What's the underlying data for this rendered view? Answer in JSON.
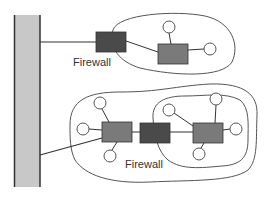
{
  "diagram": {
    "title": "",
    "colors": {
      "backbone_fill": "#c8c8c8",
      "backbone_border": "#333333",
      "firewall_fill": "#4a4a4a",
      "router_fill": "#7a7a7a",
      "line": "#333333",
      "host_fill": "#ffffff",
      "zone_outline": "#555555"
    },
    "labels": {
      "top_firewall": "Firewall",
      "bottom_firewall": "Firewall"
    },
    "nodes": [
      {
        "id": "backbone",
        "type": "network-backbone"
      },
      {
        "id": "fw-top",
        "type": "firewall",
        "label": "Firewall"
      },
      {
        "id": "router-top",
        "type": "router"
      },
      {
        "id": "router-bottom-left",
        "type": "router"
      },
      {
        "id": "fw-bottom",
        "type": "firewall",
        "label": "Firewall"
      },
      {
        "id": "router-bottom-right",
        "type": "router"
      }
    ],
    "zones": [
      {
        "id": "zone-top",
        "contains": [
          "router-top"
        ]
      },
      {
        "id": "zone-bottom-outer",
        "contains": [
          "router-bottom-left",
          "fw-bottom",
          "router-bottom-right"
        ]
      },
      {
        "id": "zone-bottom-inner",
        "contains": [
          "router-bottom-right"
        ]
      }
    ]
  }
}
